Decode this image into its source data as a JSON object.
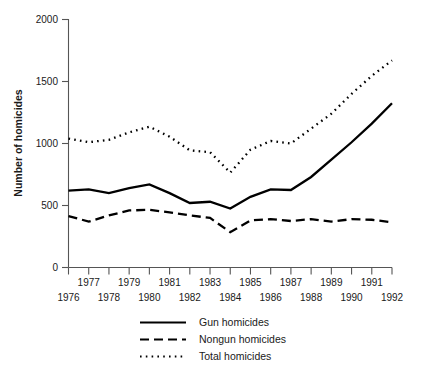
{
  "chart_data": {
    "type": "line",
    "title": "",
    "xlabel": "",
    "ylabel": "Number of homicides",
    "x": [
      1976,
      1977,
      1978,
      1979,
      1980,
      1981,
      1982,
      1983,
      1984,
      1985,
      1986,
      1987,
      1988,
      1989,
      1990,
      1991,
      1992
    ],
    "xtick_labels_upper": [
      "1977",
      "1979",
      "1981",
      "1983",
      "1985",
      "1987",
      "1989",
      "1991"
    ],
    "xtick_labels_lower": [
      "1976",
      "1978",
      "1980",
      "1982",
      "1984",
      "1986",
      "1988",
      "1990",
      "1992"
    ],
    "ytick_labels": [
      "0",
      "500",
      "1000",
      "1500",
      "2000"
    ],
    "ytick_values": [
      0,
      500,
      1000,
      1500,
      2000
    ],
    "ylim": [
      0,
      2000
    ],
    "xlim": [
      1976,
      1992
    ],
    "grid": false,
    "legend_position": "below-axes",
    "series": [
      {
        "name": "Gun homicides",
        "style": "solid",
        "color": "#000000",
        "values": [
          620,
          630,
          600,
          640,
          670,
          600,
          520,
          530,
          475,
          570,
          630,
          625,
          730,
          870,
          1010,
          1160,
          1325
        ]
      },
      {
        "name": "Nongun homicides",
        "style": "dashed",
        "color": "#000000",
        "values": [
          415,
          370,
          420,
          460,
          465,
          445,
          420,
          400,
          285,
          380,
          390,
          375,
          390,
          370,
          390,
          385,
          365
        ]
      },
      {
        "name": "Total homicides",
        "style": "dotted",
        "color": "#000000",
        "values": [
          1040,
          1010,
          1030,
          1090,
          1135,
          1055,
          945,
          930,
          765,
          950,
          1020,
          1000,
          1120,
          1240,
          1400,
          1545,
          1670
        ]
      }
    ]
  },
  "legend": {
    "items": [
      {
        "label": "Gun homicides",
        "style": "solid"
      },
      {
        "label": "Nongun homicides",
        "style": "dashed"
      },
      {
        "label": "Total homicides",
        "style": "dotted"
      }
    ]
  }
}
